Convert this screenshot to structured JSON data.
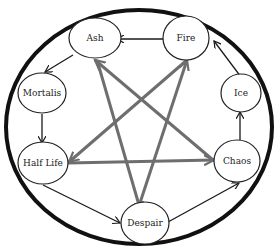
{
  "diagram": {
    "type": "cycle-with-pentagram",
    "colors": {
      "outer_circle": "#111111",
      "outer_arrows": "#1a1a1a",
      "pentagram_arrows": "#6e6e6e",
      "node_fill": "#ffffff",
      "node_stroke": "#222222"
    },
    "nodes": [
      {
        "id": "ash",
        "label": "Ash"
      },
      {
        "id": "fire",
        "label": "Fire"
      },
      {
        "id": "ice",
        "label": "Ice"
      },
      {
        "id": "chaos",
        "label": "Chaos"
      },
      {
        "id": "despair",
        "label": "Despair"
      },
      {
        "id": "half_life",
        "label": "Half Life"
      },
      {
        "id": "mortalis",
        "label": "Mortalis"
      }
    ],
    "outer_cycle_edges": [
      {
        "from": "Fire",
        "to": "Ash"
      },
      {
        "from": "Ash",
        "to": "Mortalis"
      },
      {
        "from": "Mortalis",
        "to": "Half Life"
      },
      {
        "from": "Half Life",
        "to": "Despair"
      },
      {
        "from": "Despair",
        "to": "Chaos"
      },
      {
        "from": "Chaos",
        "to": "Ice"
      },
      {
        "from": "Ice",
        "to": "Fire"
      }
    ],
    "pentagram_edges": [
      {
        "from": "Chaos",
        "to": "Ash"
      },
      {
        "from": "Ash",
        "to": "Despair"
      },
      {
        "from": "Despair",
        "to": "Fire"
      },
      {
        "from": "Fire",
        "to": "Half Life"
      },
      {
        "from": "Half Life",
        "to": "Chaos"
      }
    ]
  }
}
